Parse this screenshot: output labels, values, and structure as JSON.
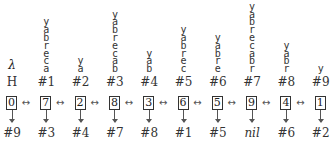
{
  "diagram": {
    "head": {
      "lambda_label": "λ",
      "label": "H"
    },
    "link_symbol": "↔",
    "columns": [
      {
        "string": "",
        "label": "H",
        "is_head": true,
        "cell": "0",
        "next": "#9"
      },
      {
        "string": "yabreca",
        "label": "#1",
        "cell": "7",
        "next": "#3"
      },
      {
        "string": "ya",
        "label": "#2",
        "cell": "2",
        "next": "#4"
      },
      {
        "string": "yabrecab",
        "label": "#3",
        "cell": "8",
        "next": "#7"
      },
      {
        "string": "yab",
        "label": "#4",
        "cell": "3",
        "next": "#8"
      },
      {
        "string": "yabrec",
        "label": "#5",
        "cell": "6",
        "next": "#1"
      },
      {
        "string": "yabre",
        "label": "#6",
        "cell": "5",
        "next": "#5"
      },
      {
        "string": "yabrecabr",
        "label": "#7",
        "cell": "9",
        "next": "nil"
      },
      {
        "string": "yabr",
        "label": "#8",
        "cell": "4",
        "next": "#6"
      },
      {
        "string": "y",
        "label": "#9",
        "cell": "1",
        "next": "#2"
      }
    ]
  }
}
